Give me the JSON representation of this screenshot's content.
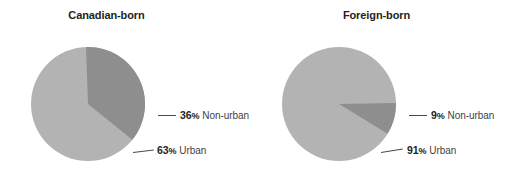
{
  "figure": {
    "background_color": "#ffffff",
    "text_color": "#231f20"
  },
  "colors": {
    "urban_slice": "#b3b3b3",
    "nonurban_slice": "#8e8e8e",
    "leader_line": "#4a4a4a"
  },
  "panels": [
    {
      "title": "Canadian-born",
      "labels": {
        "nonurban": {
          "pct": "36",
          "sym": "%",
          "category": "Non-urban"
        },
        "urban": {
          "pct": "63",
          "sym": "%",
          "category": "Urban"
        }
      }
    },
    {
      "title": "Foreign-born",
      "labels": {
        "nonurban": {
          "pct": "9",
          "sym": "%",
          "category": "Non-urban"
        },
        "urban": {
          "pct": "91",
          "sym": "%",
          "category": "Urban"
        }
      }
    }
  ],
  "chart_data": [
    {
      "type": "pie",
      "title": "Canadian-born",
      "categories": [
        "Non-urban",
        "Urban"
      ],
      "values": [
        36,
        63
      ],
      "units": "percent",
      "data_labels": [
        "36% Non-urban",
        "63% Urban"
      ],
      "colors": [
        "#8e8e8e",
        "#b3b3b3"
      ],
      "start_angle_deg": -92,
      "direction": "clockwise",
      "legend": "none",
      "grid": false
    },
    {
      "type": "pie",
      "title": "Foreign-born",
      "categories": [
        "Non-urban",
        "Urban"
      ],
      "values": [
        9,
        91
      ],
      "units": "percent",
      "data_labels": [
        "9% Non-urban",
        "91% Urban"
      ],
      "colors": [
        "#8e8e8e",
        "#b3b3b3"
      ],
      "start_angle_deg": -1,
      "direction": "clockwise",
      "legend": "none",
      "grid": false
    }
  ]
}
